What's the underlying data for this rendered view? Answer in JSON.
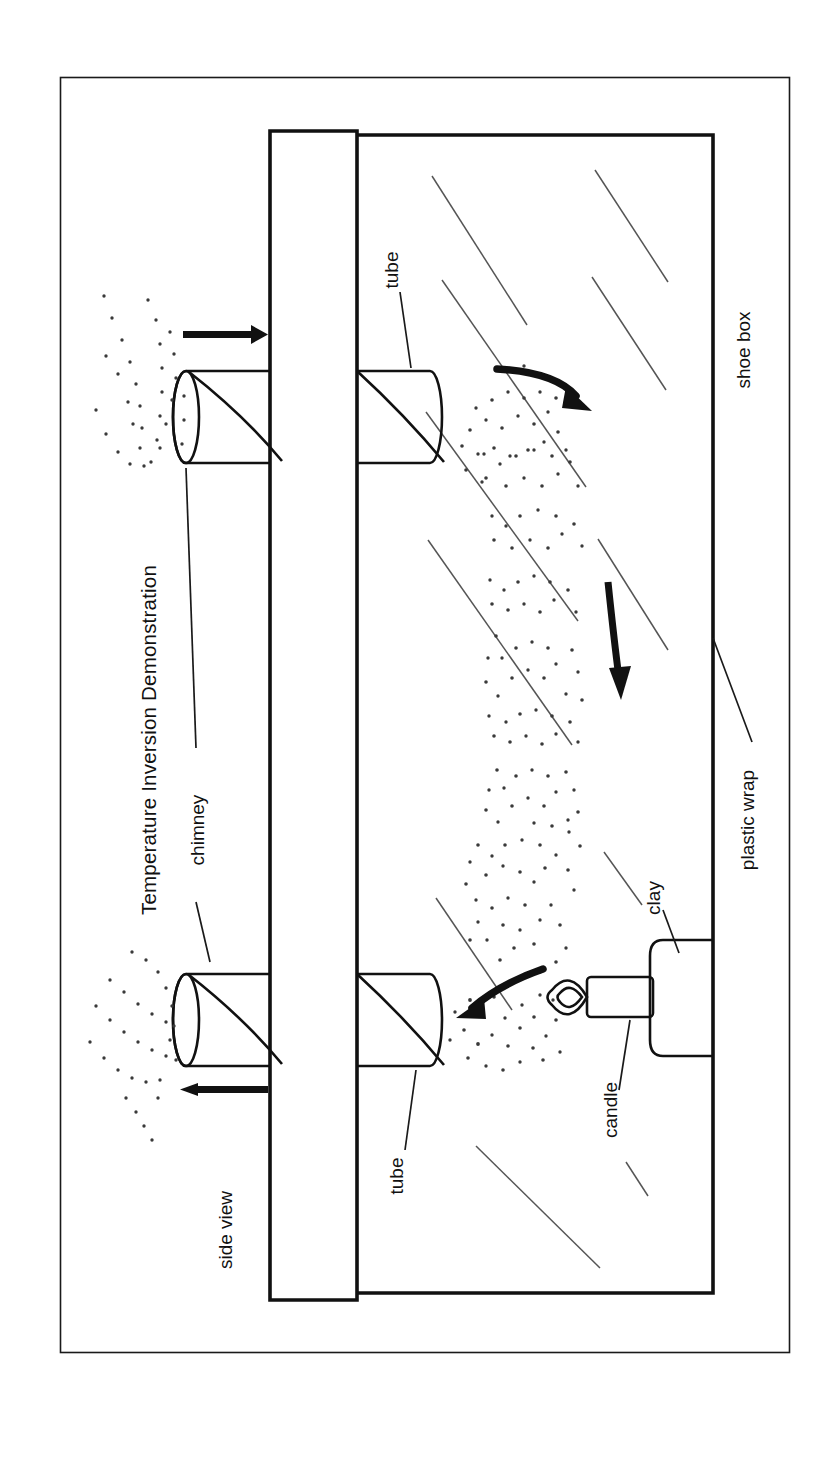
{
  "figure": {
    "title": "Temperature Inversion Demonstration",
    "view_label": "side view",
    "labels": {
      "chimney": "chimney",
      "tube_upper": "tube",
      "tube_lower": "tube",
      "shoe_box": "shoe box",
      "plastic_wrap": "plastic wrap",
      "candle": "candle",
      "clay": "clay"
    },
    "icons": {
      "arrow_out_upper": "arrow-right-icon",
      "arrow_out_lower": "arrow-left-icon",
      "flow_top": "curved-arrow-down-right-icon",
      "flow_middle": "arrow-down-icon",
      "flow_bottom": "curved-arrow-left-icon",
      "flame": "candle-flame-icon",
      "smoke": "smoke-stipple-icon",
      "hatching": "diagonal-hatch-icon"
    },
    "colors": {
      "ink": "#111111",
      "hatch": "#555555",
      "smoke": "#3a3a3a",
      "paper": "#ffffff"
    }
  }
}
